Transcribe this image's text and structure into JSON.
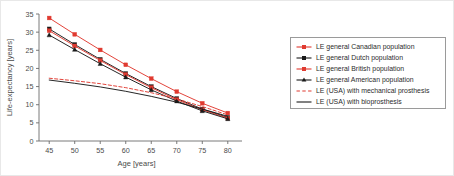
{
  "figure": {
    "background_color": "#ffffff",
    "border_color": "#e8e8e8"
  },
  "chart_data": {
    "type": "line",
    "title": "",
    "xlabel": "Age [years]",
    "ylabel": "Life-expectancy [years]",
    "x": [
      45,
      50,
      55,
      60,
      65,
      70,
      75,
      80
    ],
    "xlim": [
      43,
      82
    ],
    "ylim": [
      0,
      35
    ],
    "xticks": [
      45,
      50,
      55,
      60,
      65,
      70,
      75,
      80
    ],
    "yticks": [
      0,
      5,
      10,
      15,
      20,
      25,
      30,
      35
    ],
    "grid": false,
    "legend_position": "right",
    "series": [
      {
        "name": "LE general Canadian population",
        "color": "#e03a30",
        "marker": "square",
        "linestyle": "solid",
        "values": [
          33.9,
          29.4,
          25.1,
          21.0,
          17.2,
          13.6,
          10.4,
          7.7
        ]
      },
      {
        "name": "LE general Dutch population",
        "color": "#1a1a1a",
        "marker": "square",
        "linestyle": "solid",
        "values": [
          30.9,
          26.6,
          22.5,
          18.6,
          15.0,
          11.7,
          8.8,
          6.5
        ]
      },
      {
        "name": "LE general British population",
        "color": "#e03a30",
        "marker": "square",
        "linestyle": "solid",
        "values": [
          30.4,
          26.2,
          22.2,
          18.3,
          14.7,
          11.4,
          8.6,
          6.3
        ]
      },
      {
        "name": "LE general American population",
        "color": "#1a1a1a",
        "marker": "triangle",
        "linestyle": "solid",
        "values": [
          29.2,
          25.2,
          21.3,
          17.6,
          14.1,
          11.0,
          8.3,
          6.1
        ]
      },
      {
        "name": "LE (USA) with mechanical prosthesis",
        "color": "#e03a30",
        "marker": "none",
        "linestyle": "dashed",
        "values": [
          17.3,
          16.6,
          15.8,
          14.7,
          13.3,
          11.6,
          9.5,
          7.2
        ]
      },
      {
        "name": "LE (USA) with bioprosthesis",
        "color": "#1a1a1a",
        "marker": "none",
        "linestyle": "solid",
        "values": [
          16.8,
          15.9,
          14.9,
          13.7,
          12.3,
          10.7,
          8.8,
          6.8
        ]
      }
    ]
  },
  "legend": {
    "border_color": "#9a9a9a",
    "items": [
      {
        "label": "LE general Canadian population"
      },
      {
        "label": "LE general Dutch population"
      },
      {
        "label": "LE general British population"
      },
      {
        "label": "LE general American population"
      },
      {
        "label": "LE (USA) with mechanical prosthesis"
      },
      {
        "label": "LE (USA) with bioprosthesis"
      }
    ]
  }
}
